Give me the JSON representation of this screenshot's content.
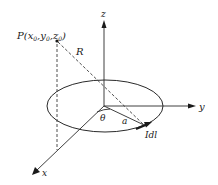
{
  "diagram": {
    "type": "3d-coordinate-geometry",
    "labels": {
      "point_p": "P(x",
      "point_p_sub0": "0",
      "point_p_comma1": ",y",
      "point_p_sub1": "0",
      "point_p_comma2": ",z",
      "point_p_sub2": "0",
      "point_p_close": ")",
      "distance_r": "R",
      "axis_x": "x",
      "axis_y": "y",
      "axis_z": "z",
      "angle": "θ",
      "radius": "a",
      "current_element": "Idl"
    },
    "colors": {
      "line": "#2a2a2a",
      "text": "#1a1a1a",
      "background": "#ffffff"
    }
  }
}
